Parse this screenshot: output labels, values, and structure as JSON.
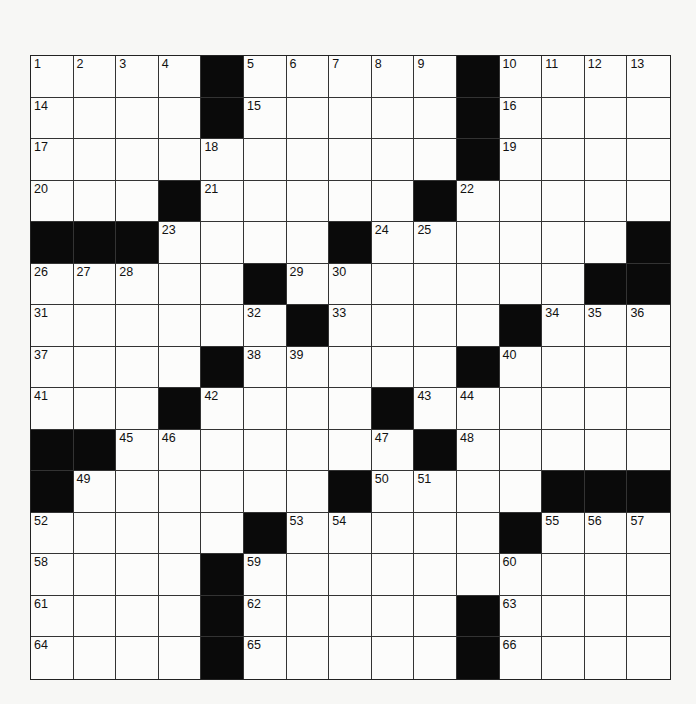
{
  "puzzle": {
    "type": "crossword",
    "rows": 15,
    "cols": 15,
    "colors": {
      "black_square": "#0a0a0a",
      "white_square": "#fcfcfb",
      "border": "#222222",
      "background": "#f7f7f5"
    },
    "black_squares": [
      [
        0,
        4
      ],
      [
        0,
        10
      ],
      [
        1,
        4
      ],
      [
        1,
        10
      ],
      [
        2,
        10
      ],
      [
        3,
        3
      ],
      [
        3,
        9
      ],
      [
        4,
        0
      ],
      [
        4,
        1
      ],
      [
        4,
        2
      ],
      [
        4,
        7
      ],
      [
        4,
        14
      ],
      [
        5,
        5
      ],
      [
        5,
        13
      ],
      [
        5,
        14
      ],
      [
        6,
        6
      ],
      [
        6,
        11
      ],
      [
        7,
        4
      ],
      [
        7,
        10
      ],
      [
        8,
        3
      ],
      [
        8,
        8
      ],
      [
        9,
        0
      ],
      [
        9,
        1
      ],
      [
        9,
        9
      ],
      [
        10,
        0
      ],
      [
        10,
        7
      ],
      [
        10,
        12
      ],
      [
        10,
        13
      ],
      [
        10,
        14
      ],
      [
        11,
        5
      ],
      [
        11,
        11
      ],
      [
        12,
        4
      ],
      [
        13,
        4
      ],
      [
        13,
        10
      ],
      [
        14,
        4
      ],
      [
        14,
        10
      ]
    ],
    "numbered_cells": [
      {
        "n": "1",
        "r": 0,
        "c": 0
      },
      {
        "n": "2",
        "r": 0,
        "c": 1
      },
      {
        "n": "3",
        "r": 0,
        "c": 2
      },
      {
        "n": "4",
        "r": 0,
        "c": 3
      },
      {
        "n": "5",
        "r": 0,
        "c": 5
      },
      {
        "n": "6",
        "r": 0,
        "c": 6
      },
      {
        "n": "7",
        "r": 0,
        "c": 7
      },
      {
        "n": "8",
        "r": 0,
        "c": 8
      },
      {
        "n": "9",
        "r": 0,
        "c": 9
      },
      {
        "n": "10",
        "r": 0,
        "c": 11
      },
      {
        "n": "11",
        "r": 0,
        "c": 12
      },
      {
        "n": "12",
        "r": 0,
        "c": 13
      },
      {
        "n": "13",
        "r": 0,
        "c": 14
      },
      {
        "n": "14",
        "r": 1,
        "c": 0
      },
      {
        "n": "15",
        "r": 1,
        "c": 5
      },
      {
        "n": "16",
        "r": 1,
        "c": 11
      },
      {
        "n": "17",
        "r": 2,
        "c": 0
      },
      {
        "n": "18",
        "r": 2,
        "c": 4
      },
      {
        "n": "19",
        "r": 2,
        "c": 11
      },
      {
        "n": "20",
        "r": 3,
        "c": 0
      },
      {
        "n": "21",
        "r": 3,
        "c": 4
      },
      {
        "n": "22",
        "r": 3,
        "c": 10
      },
      {
        "n": "23",
        "r": 4,
        "c": 3
      },
      {
        "n": "24",
        "r": 4,
        "c": 8
      },
      {
        "n": "25",
        "r": 4,
        "c": 9
      },
      {
        "n": "26",
        "r": 5,
        "c": 0
      },
      {
        "n": "27",
        "r": 5,
        "c": 1
      },
      {
        "n": "28",
        "r": 5,
        "c": 2
      },
      {
        "n": "29",
        "r": 5,
        "c": 6
      },
      {
        "n": "30",
        "r": 5,
        "c": 7
      },
      {
        "n": "31",
        "r": 6,
        "c": 0
      },
      {
        "n": "32",
        "r": 6,
        "c": 5
      },
      {
        "n": "33",
        "r": 6,
        "c": 7
      },
      {
        "n": "34",
        "r": 6,
        "c": 12
      },
      {
        "n": "35",
        "r": 6,
        "c": 13
      },
      {
        "n": "36",
        "r": 6,
        "c": 14
      },
      {
        "n": "37",
        "r": 7,
        "c": 0
      },
      {
        "n": "38",
        "r": 7,
        "c": 5
      },
      {
        "n": "39",
        "r": 7,
        "c": 6
      },
      {
        "n": "40",
        "r": 7,
        "c": 11
      },
      {
        "n": "41",
        "r": 8,
        "c": 0
      },
      {
        "n": "42",
        "r": 8,
        "c": 4
      },
      {
        "n": "43",
        "r": 8,
        "c": 9
      },
      {
        "n": "44",
        "r": 8,
        "c": 10
      },
      {
        "n": "45",
        "r": 9,
        "c": 2
      },
      {
        "n": "46",
        "r": 9,
        "c": 3
      },
      {
        "n": "47",
        "r": 9,
        "c": 8
      },
      {
        "n": "48",
        "r": 9,
        "c": 10
      },
      {
        "n": "49",
        "r": 10,
        "c": 1
      },
      {
        "n": "50",
        "r": 10,
        "c": 8
      },
      {
        "n": "51",
        "r": 10,
        "c": 9
      },
      {
        "n": "52",
        "r": 11,
        "c": 0
      },
      {
        "n": "53",
        "r": 11,
        "c": 6
      },
      {
        "n": "54",
        "r": 11,
        "c": 7
      },
      {
        "n": "55",
        "r": 11,
        "c": 12
      },
      {
        "n": "56",
        "r": 11,
        "c": 13
      },
      {
        "n": "57",
        "r": 11,
        "c": 14
      },
      {
        "n": "58",
        "r": 12,
        "c": 0
      },
      {
        "n": "59",
        "r": 12,
        "c": 5
      },
      {
        "n": "60",
        "r": 12,
        "c": 11
      },
      {
        "n": "61",
        "r": 13,
        "c": 0
      },
      {
        "n": "62",
        "r": 13,
        "c": 5
      },
      {
        "n": "63",
        "r": 13,
        "c": 11
      },
      {
        "n": "64",
        "r": 14,
        "c": 0
      },
      {
        "n": "65",
        "r": 14,
        "c": 5
      },
      {
        "n": "66",
        "r": 14,
        "c": 11
      }
    ]
  }
}
